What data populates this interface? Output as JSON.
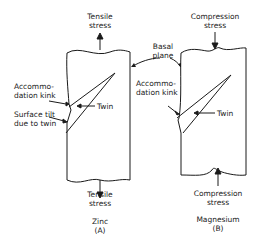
{
  "diagram": {
    "panel_a": {
      "top_label_line1": "Tensile",
      "top_label_line2": "stress",
      "bottom_label_line1": "Tensile",
      "bottom_label_line2": "stress",
      "material": "Zinc",
      "panel_id": "(A)",
      "callouts": {
        "kink_line1": "Accommo-",
        "kink_line2": "dation kink",
        "tilt_line1": "Surface tilt",
        "tilt_line2": "due to twin",
        "twin": "Twin"
      }
    },
    "panel_b": {
      "top_label_line1": "Compression",
      "top_label_line2": "stress",
      "bottom_label_line1": "Compression",
      "bottom_label_line2": "stress",
      "material": "Magnesium",
      "panel_id": "(B)",
      "callouts": {
        "kink_line1": "Accommo-",
        "kink_line2": "dation kink",
        "twin": "Twin"
      }
    },
    "shared": {
      "basal_line1": "Basal",
      "basal_line2": "plane"
    },
    "colors": {
      "line": "#1a1a1a",
      "background": "#ffffff"
    }
  }
}
